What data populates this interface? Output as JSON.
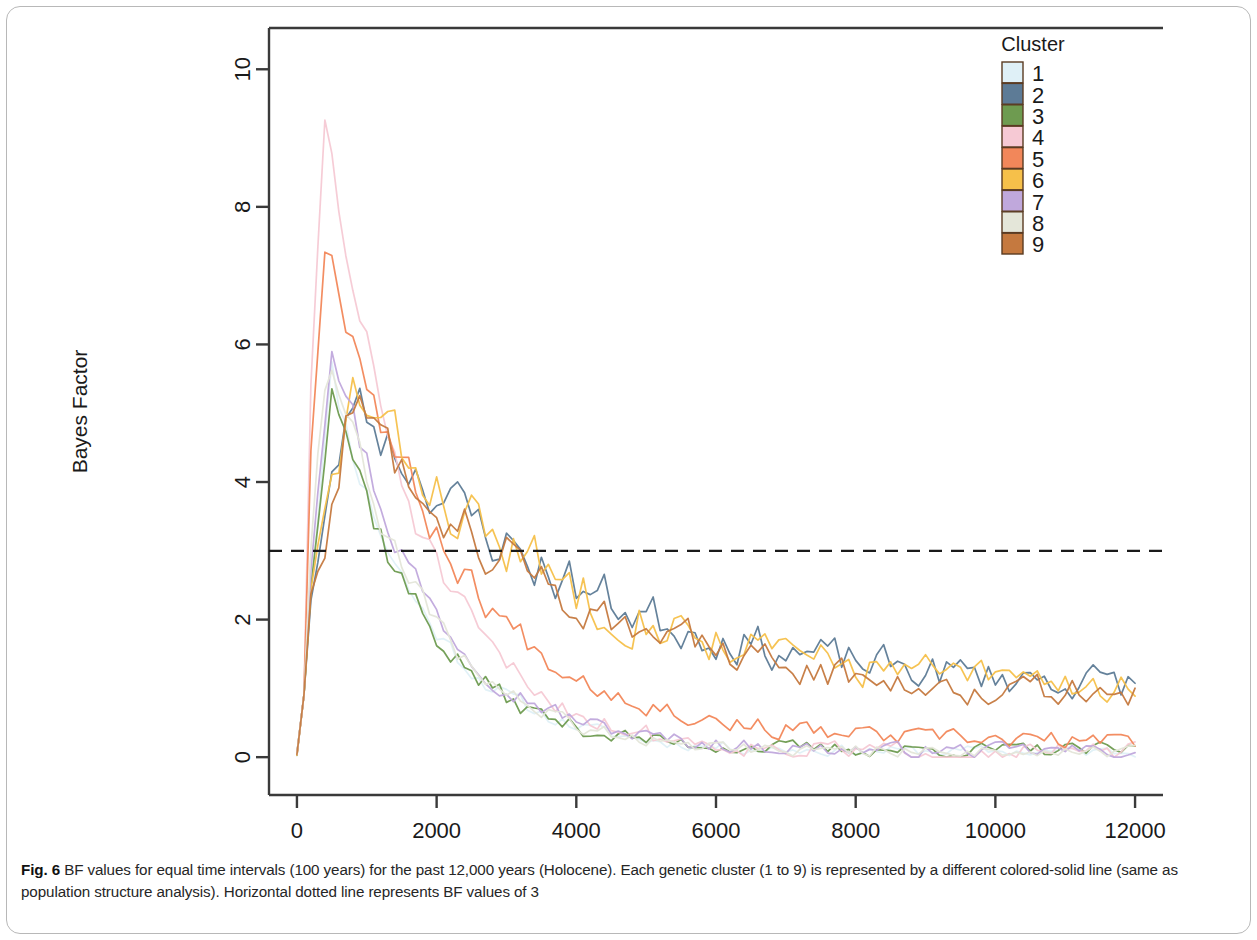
{
  "figure": {
    "number": "Fig. 6",
    "caption_label": "Fig. 6",
    "caption_text": " BF values for equal time intervals (100 years) for the past 12,000 years (Holocene). Each genetic cluster (1 to 9) is represented by a different colored-solid line (same as population structure analysis). Horizontal dotted line represents BF values of 3"
  },
  "chart_data": {
    "type": "line",
    "title": "",
    "xlabel": "T (years)",
    "ylabel": "Bayes Factor",
    "xlim": [
      -400,
      12400
    ],
    "ylim": [
      -0.55,
      10.6
    ],
    "xticks": [
      0,
      2000,
      4000,
      6000,
      8000,
      10000,
      12000
    ],
    "xtick_labels": [
      "0",
      "2000",
      "4000",
      "6000",
      "8000",
      "10000",
      "12000"
    ],
    "yticks": [
      0,
      2,
      4,
      6,
      8,
      10
    ],
    "ytick_labels": [
      "0",
      "2",
      "4",
      "6",
      "8",
      "10"
    ],
    "grid": false,
    "legend_position": "top-right",
    "legend_title": "Cluster",
    "annotations": [
      {
        "name": "bf-threshold-line",
        "type": "hline",
        "y": 3,
        "style": "dashed",
        "color": "#1a1a1a",
        "label": "BF = 3"
      }
    ],
    "x_interval_years": 100,
    "n_points": 120,
    "series": [
      {
        "name": "1",
        "label": "1",
        "color": "#dff0f7",
        "group": "low",
        "peak_value": 5.6,
        "peak_x": 500,
        "decay": 1500,
        "tail_value": 0.08,
        "noise": 0.16,
        "seed": 11
      },
      {
        "name": "2",
        "label": "2",
        "color": "#5d7b96",
        "group": "high",
        "peak_value": 5.25,
        "peak_x": 800,
        "decay": 3600,
        "tail_value": 0.95,
        "noise": 0.3,
        "seed": 23
      },
      {
        "name": "3",
        "label": "3",
        "color": "#6e9b50",
        "group": "low",
        "peak_value": 5.6,
        "peak_x": 500,
        "decay": 1450,
        "tail_value": 0.1,
        "noise": 0.2,
        "seed": 37
      },
      {
        "name": "4",
        "label": "4",
        "color": "#f6c9d4",
        "group": "low",
        "peak_value": 9.3,
        "peak_x": 400,
        "decay": 1500,
        "tail_value": 0.07,
        "noise": 0.26,
        "seed": 51
      },
      {
        "name": "5",
        "label": "5",
        "color": "#f2875a",
        "group": "mid",
        "peak_value": 7.7,
        "peak_x": 400,
        "decay": 2050,
        "tail_value": 0.22,
        "noise": 0.24,
        "seed": 67
      },
      {
        "name": "6",
        "label": "6",
        "color": "#f6c04a",
        "group": "high",
        "peak_value": 5.3,
        "peak_x": 800,
        "decay": 3500,
        "tail_value": 0.92,
        "noise": 0.32,
        "seed": 83
      },
      {
        "name": "7",
        "label": "7",
        "color": "#c0a8dc",
        "group": "low",
        "peak_value": 6.2,
        "peak_x": 500,
        "decay": 1550,
        "tail_value": 0.09,
        "noise": 0.2,
        "seed": 97
      },
      {
        "name": "8",
        "label": "8",
        "color": "#e4e6d9",
        "group": "low",
        "peak_value": 6.1,
        "peak_x": 450,
        "decay": 1500,
        "tail_value": 0.08,
        "noise": 0.18,
        "seed": 109
      },
      {
        "name": "9",
        "label": "9",
        "color": "#c5793f",
        "group": "high",
        "peak_value": 5.2,
        "peak_x": 800,
        "decay": 3400,
        "tail_value": 0.8,
        "noise": 0.28,
        "seed": 127
      }
    ]
  },
  "plot_geometry": {
    "frame_left": 262,
    "frame_top": 21,
    "frame_right": 1156,
    "frame_bottom": 788,
    "axis_color": "#3a3a3a"
  }
}
